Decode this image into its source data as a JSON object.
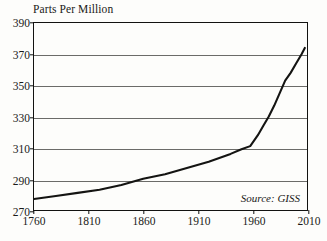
{
  "chart_data": {
    "type": "line",
    "title": "Parts Per Million",
    "xlabel": "",
    "ylabel": "Parts Per Million",
    "xlim": [
      1760,
      2010
    ],
    "ylim": [
      270,
      390
    ],
    "grid": true,
    "legend": null,
    "xticks": [
      1760,
      1810,
      1860,
      1910,
      1960,
      2010
    ],
    "yticks": [
      270,
      290,
      310,
      330,
      350,
      370,
      390
    ],
    "annotations": [
      {
        "text": "Source: GISS",
        "position": "bottom-right",
        "style": "italic"
      }
    ],
    "series": [
      {
        "name": "Atmospheric CO2 concentration",
        "color": "#141412",
        "x": [
          1760,
          1780,
          1800,
          1820,
          1840,
          1860,
          1880,
          1900,
          1920,
          1940,
          1950,
          1958,
          1965,
          1970,
          1975,
          1980,
          1985,
          1990,
          1995,
          2000,
          2005,
          2008
        ],
        "values": [
          277,
          279,
          281,
          283,
          286,
          290,
          293,
          297,
          301,
          306,
          309,
          311,
          318,
          324,
          330,
          337,
          345,
          353,
          358,
          364,
          370,
          374
        ]
      }
    ]
  },
  "source": {
    "label": "Source: GISS"
  },
  "colors": {
    "line": "#141412",
    "grid": "#6b6b68",
    "frame": "#121210",
    "text": "#1a1a18",
    "background": "#fdfdfb"
  }
}
